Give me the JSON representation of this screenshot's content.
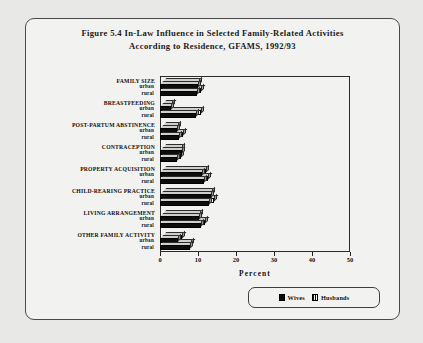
{
  "figure": {
    "title_line1": "Figure 5.4   In-Law Influence in Selected Family-Related Activities",
    "title_line2": "According to Residence, GFAMS, 1992/93"
  },
  "legend": {
    "items": [
      {
        "label": "Wives",
        "swatch": "solid-black-square-icon",
        "color": "#0d0d0d"
      },
      {
        "label": "Husbands",
        "swatch": "hatched-square-icon",
        "color": "#0f0f0f"
      }
    ]
  },
  "axis": {
    "xlabel": "Percent",
    "ticks": [
      "0",
      "10",
      "20",
      "30",
      "40",
      "50"
    ]
  },
  "subgroups": {
    "urban": "urban",
    "rural": "rural"
  },
  "chart_data": {
    "type": "bar",
    "orientation": "horizontal",
    "title": "Figure 5.4 In-Law Influence in Selected Family-Related Activities According to Residence, GFAMS, 1992/93",
    "xlabel": "Percent",
    "ylabel": "",
    "xlim": [
      0,
      50
    ],
    "xticks": [
      0,
      10,
      20,
      30,
      40,
      50
    ],
    "grid": false,
    "legend_position": "bottom-right",
    "categories": [
      "FAMILY SIZE",
      "BREASTFEEDING",
      "POST-PARTUM ABSTINENCE",
      "CONTRACEPTION",
      "PROPERTY ACQUISITION",
      "CHILD-REARING PRACTICE",
      "LIVING ARRANGEMENT",
      "OTHER FAMILY ACTIVITY"
    ],
    "subgroups": [
      "urban",
      "rural"
    ],
    "series": [
      {
        "name": "Wives",
        "values": {
          "FAMILY SIZE": {
            "urban": 10.0,
            "rural": 9.8
          },
          "BREASTFEEDING": {
            "urban": 3.0,
            "rural": 9.6
          },
          "POST-PARTUM ABSTINENCE": {
            "urban": 4.6,
            "rural": 5.0
          },
          "CONTRACEPTION": {
            "urban": 5.8,
            "rural": 4.4
          },
          "PROPERTY ACQUISITION": {
            "urban": 11.0,
            "rural": 11.6
          },
          "CHILD-REARING PRACTICE": {
            "urban": 13.4,
            "rural": 13.0
          },
          "LIVING ARRANGEMENT": {
            "urban": 10.2,
            "rural": 10.8
          },
          "OTHER FAMILY ACTIVITY": {
            "urban": 4.8,
            "rural": 8.0
          }
        }
      },
      {
        "name": "Husbands",
        "values": {
          "FAMILY SIZE": {
            "urban": 9.6,
            "rural": 10.2
          },
          "BREASTFEEDING": {
            "urban": 2.6,
            "rural": 10.0
          },
          "POST-PARTUM ABSTINENCE": {
            "urban": 4.0,
            "rural": 5.4
          },
          "CONTRACEPTION": {
            "urban": 5.0,
            "rural": 4.8
          },
          "PROPERTY ACQUISITION": {
            "urban": 11.4,
            "rural": 12.0
          },
          "CHILD-REARING PRACTICE": {
            "urban": 13.0,
            "rural": 13.6
          },
          "LIVING ARRANGEMENT": {
            "urban": 9.8,
            "rural": 11.2
          },
          "OTHER FAMILY ACTIVITY": {
            "urban": 5.2,
            "rural": 7.6
          }
        }
      }
    ]
  }
}
